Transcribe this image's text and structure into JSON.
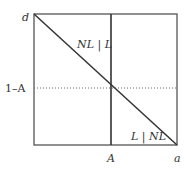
{
  "diagram": {
    "axis_labels": {
      "top_left": "d",
      "left_mark": "1–A",
      "bottom_mark": "A",
      "bottom_right": "a"
    },
    "region_labels": {
      "upper": "NL | L",
      "lower": "L | NL"
    },
    "colors": {
      "line": "#333333",
      "box": "#555555",
      "dotted": "#666666"
    }
  }
}
